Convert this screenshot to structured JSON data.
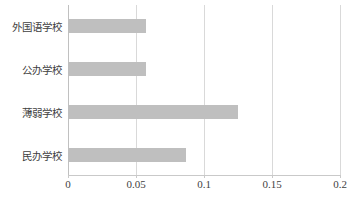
{
  "chart_data": {
    "type": "bar",
    "orientation": "horizontal",
    "title": "",
    "subtitle": "",
    "xlabel": "",
    "ylabel": "",
    "categories": [
      "民办学校",
      "薄弱学校",
      "公办学校",
      "外国语学校"
    ],
    "values": [
      0.087,
      0.125,
      0.057,
      0.057
    ],
    "series": [
      {
        "name": "",
        "values": [
          0.087,
          0.125,
          0.057,
          0.057
        ]
      }
    ],
    "xlim": [
      0,
      0.2
    ],
    "xticks": [
      0,
      0.05,
      0.1,
      0.15,
      0.2
    ],
    "xtick_labels": [
      "0",
      "0.05",
      "0.1",
      "0.15",
      "0.2"
    ],
    "grid": "vertical",
    "legend": "none",
    "bar_color": "#bfbfbf",
    "gridline_color": "#d9d9d9",
    "axis_color": "#c9c9c9",
    "text_color": "#3f3f3f"
  },
  "axis": {
    "ticks": [
      {
        "label": "0",
        "value": 0
      },
      {
        "label": "0.05",
        "value": 0.05
      },
      {
        "label": "0.1",
        "value": 0.1
      },
      {
        "label": "0.15",
        "value": 0.15
      },
      {
        "label": "0.2",
        "value": 0.2
      }
    ]
  },
  "bars": [
    {
      "label": "外国语学校",
      "value": 0.057
    },
    {
      "label": "公办学校",
      "value": 0.057
    },
    {
      "label": "薄弱学校",
      "value": 0.125
    },
    {
      "label": "民办学校",
      "value": 0.087
    }
  ]
}
